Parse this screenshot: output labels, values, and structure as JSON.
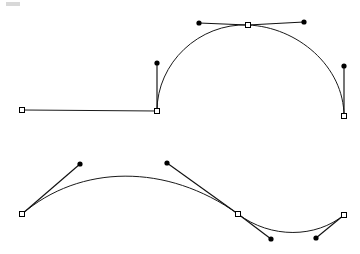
{
  "document": {
    "title": "Bezier Path Editor Canvas",
    "width": 360,
    "height": 254,
    "background_color": "#ffffff",
    "stroke_color": "#1a1a1a",
    "anchor_fill_color": "#ffffff",
    "anchor_stroke_color": "#000000",
    "handle_color": "#000000"
  },
  "paths": [
    {
      "id": "path-upper",
      "name": "upper-path",
      "label": "Upper path: straight segment into arc",
      "d": "M 22 110 L 157 111 C 157 63 199 23 248 25 C 297 27 344 66 344 116",
      "anchors": [
        {
          "name": "anchor-upper-1",
          "x": 22,
          "y": 110,
          "type": "corner"
        },
        {
          "name": "anchor-upper-2",
          "x": 157,
          "y": 111,
          "type": "corner"
        },
        {
          "name": "anchor-upper-3",
          "x": 248,
          "y": 25,
          "type": "smooth"
        },
        {
          "name": "anchor-upper-4",
          "x": 344,
          "y": 116,
          "type": "corner"
        }
      ],
      "handles": [
        {
          "name": "handle-upper-a",
          "anchor_x": 157,
          "anchor_y": 111,
          "x": 157,
          "y": 63
        },
        {
          "name": "handle-upper-b",
          "anchor_x": 248,
          "anchor_y": 25,
          "x": 199,
          "y": 23
        },
        {
          "name": "handle-upper-c",
          "anchor_x": 248,
          "anchor_y": 25,
          "x": 304,
          "y": 22
        },
        {
          "name": "handle-upper-d",
          "anchor_x": 344,
          "anchor_y": 116,
          "x": 344,
          "y": 66
        }
      ]
    },
    {
      "id": "path-lower",
      "name": "lower-path",
      "label": "Lower path: S-shaped wave",
      "d": "M 22 214 C 80 164 167 163 238 214 C 271 239 316 238 344 215",
      "anchors": [
        {
          "name": "anchor-lower-1",
          "x": 22,
          "y": 214,
          "type": "corner"
        },
        {
          "name": "anchor-lower-2",
          "x": 238,
          "y": 214,
          "type": "smooth"
        },
        {
          "name": "anchor-lower-3",
          "x": 344,
          "y": 215,
          "type": "corner"
        }
      ],
      "handles": [
        {
          "name": "handle-lower-a",
          "anchor_x": 22,
          "anchor_y": 214,
          "x": 80,
          "y": 164
        },
        {
          "name": "handle-lower-b",
          "anchor_x": 238,
          "anchor_y": 214,
          "x": 167,
          "y": 163
        },
        {
          "name": "handle-lower-c",
          "anchor_x": 238,
          "anchor_y": 214,
          "x": 271,
          "y": 239
        },
        {
          "name": "handle-lower-d",
          "anchor_x": 344,
          "anchor_y": 215,
          "x": 316,
          "y": 238
        }
      ]
    }
  ],
  "marks": [
    {
      "name": "corner-speck",
      "x": 6,
      "y": 2,
      "width": 14,
      "height": 4
    }
  ],
  "geometry": {
    "anchor_size": 5,
    "handle_dot_radius": 2.6
  }
}
